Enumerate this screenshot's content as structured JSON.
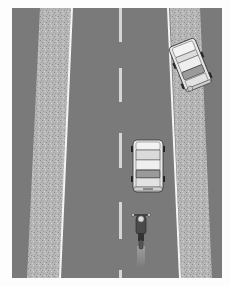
{
  "scene": {
    "description": "Top-down illustration of a two-lane road with a parked car on the right shoulder, a car driving in the right lane, and a motorcycle following behind it",
    "colors": {
      "background": "#fdfdfd",
      "asphalt": "#7a7a7a",
      "gravel": "#b4b4b4",
      "edge_line": "#f4f4f4",
      "center_dash": "#d8d8d8",
      "car_body": "#e6e6e6",
      "car_outline": "#333333",
      "glass": "#9a9a9a"
    },
    "elements": {
      "road": "two-lane-road",
      "center_line": "dashed-center-line",
      "left_shoulder": "gravel-shoulder-left",
      "right_shoulder": "gravel-shoulder-right",
      "parked_car": "car-parked-on-shoulder",
      "moving_car": "car-in-right-lane",
      "motorcycle": "motorcycle-behind-car"
    }
  }
}
